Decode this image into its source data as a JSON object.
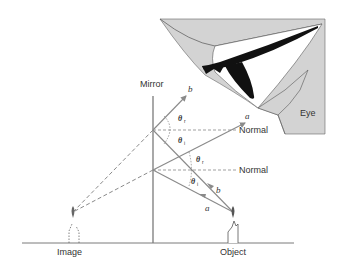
{
  "diagram": {
    "type": "plane-mirror-reflection",
    "labels": {
      "mirror": "Mirror",
      "eye": "Eye",
      "normal_upper": "Normal",
      "normal_lower": "Normal",
      "image": "Image",
      "object": "Object",
      "ray_b_out": "b",
      "ray_a_out": "a",
      "ray_b_in": "b",
      "ray_a_in": "a"
    },
    "angles": {
      "upper_reflected": {
        "symbol": "θ",
        "subscript": "r"
      },
      "upper_incident": {
        "symbol": "θ",
        "subscript": "i"
      },
      "lower_reflected": {
        "symbol": "θ",
        "subscript": "r"
      },
      "lower_incident": {
        "symbol": "θ",
        "subscript": "i"
      }
    },
    "colors": {
      "ray": "#8a8a8a",
      "mirror": "#7a7a7a",
      "eye_fill": "#d3d3d3",
      "text": "#333333",
      "pupil": "#111111"
    }
  }
}
